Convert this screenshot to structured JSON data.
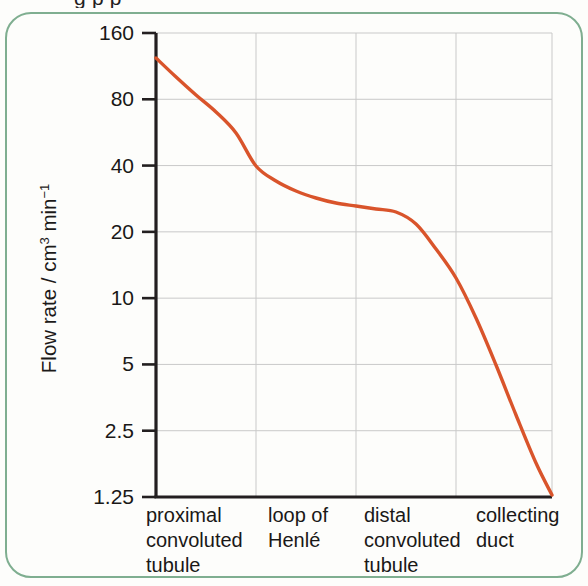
{
  "clipped_caption": "g               p                 p",
  "figure": {
    "frame_color": "#7fae90",
    "background": "#fdfdfb"
  },
  "chart_data": {
    "type": "line",
    "title": "",
    "subtitle": "",
    "xlabel": "",
    "ylabel": "Flow rate / cm3 min-1",
    "ylabel_parts": {
      "prefix": "Flow rate / cm",
      "sup1": "3",
      "mid": " min",
      "sup2": "−1"
    },
    "yscale": "log",
    "ylim": [
      1.25,
      160
    ],
    "ytick_values": [
      160,
      80,
      40,
      20,
      10,
      5,
      2.5,
      1.25
    ],
    "ytick_labels": [
      "160",
      "80",
      "40",
      "20",
      "10",
      "5",
      "2.5",
      "1.25"
    ],
    "grid": true,
    "grid_color": "#c9c9c9",
    "axis_color": "#231f20",
    "legend": "none",
    "series": [
      {
        "name": "filtrate flow rate",
        "color": "#d9542b",
        "line_width": 3.4,
        "x": [
          0.0,
          0.05,
          0.12,
          0.2,
          0.28,
          0.36,
          0.44,
          0.52,
          0.6,
          0.68,
          0.76,
          0.84,
          0.92,
          1.0
        ],
        "y": [
          125,
          108,
          88,
          70,
          55,
          43,
          37,
          33,
          30,
          28,
          27,
          26.4,
          26,
          25.8
        ]
      }
    ],
    "curve_points_px": [
      [
        156,
        58
      ],
      [
        175,
        76
      ],
      [
        196,
        95
      ],
      [
        216,
        112
      ],
      [
        236,
        133
      ],
      [
        256,
        166
      ],
      [
        276,
        181
      ],
      [
        296,
        191
      ],
      [
        316,
        198
      ],
      [
        336,
        203
      ],
      [
        356,
        206
      ],
      [
        376,
        209
      ],
      [
        396,
        212
      ],
      [
        416,
        224
      ],
      [
        436,
        249
      ],
      [
        456,
        278
      ],
      [
        476,
        318
      ],
      [
        496,
        365
      ],
      [
        516,
        415
      ],
      [
        536,
        463
      ],
      [
        552,
        495
      ]
    ],
    "categories": [
      {
        "lines": [
          "proximal",
          "convoluted",
          "tubule"
        ],
        "x_px": 146
      },
      {
        "lines": [
          "loop of",
          "Henlé"
        ],
        "x_px": 268
      },
      {
        "lines": [
          "distal",
          "convoluted",
          "tubule"
        ],
        "x_px": 364
      },
      {
        "lines": [
          "collecting",
          "duct"
        ],
        "x_px": 476
      }
    ],
    "category_boundaries_px": [
      256,
      356,
      456
    ],
    "plot_area_px": {
      "left": 156,
      "right": 552,
      "top": 33,
      "bottom": 497
    },
    "annotations": []
  }
}
